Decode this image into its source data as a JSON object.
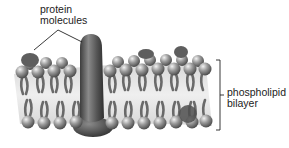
{
  "diagram": {
    "labels": {
      "protein_line1": "protein",
      "protein_line2": "molecules",
      "bilayer_line1": "phospholipid",
      "bilayer_line2": "bilayer"
    },
    "colors": {
      "head": "#8a8a8a",
      "head_highlight": "#e6e6e6",
      "tail": "#6f6f6f",
      "interior": "#e4e4e4",
      "protein": "#5a5a5a",
      "text": "#222222",
      "line": "#222222"
    }
  }
}
